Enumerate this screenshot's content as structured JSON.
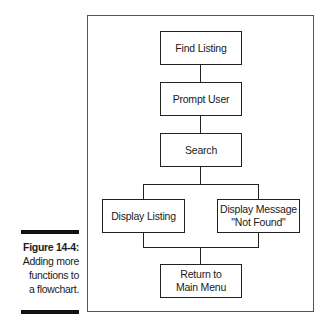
{
  "figure": {
    "number_label": "Figure 14-4:",
    "caption_lines": [
      "Adding more",
      "functions to",
      "a flowchart."
    ]
  },
  "flowchart": {
    "nodes": [
      {
        "id": "find-listing",
        "lines": [
          "Find Listing"
        ]
      },
      {
        "id": "prompt-user",
        "lines": [
          "Prompt User"
        ]
      },
      {
        "id": "search",
        "lines": [
          "Search"
        ]
      },
      {
        "id": "display-listing",
        "lines": [
          "Display Listing"
        ]
      },
      {
        "id": "display-message",
        "lines": [
          "Display Message",
          "\"Not Found\""
        ]
      },
      {
        "id": "return-main-menu",
        "lines": [
          "Return to",
          "Main Menu"
        ]
      }
    ],
    "edges": [
      [
        "find-listing",
        "prompt-user"
      ],
      [
        "prompt-user",
        "search"
      ],
      [
        "search",
        "display-listing"
      ],
      [
        "search",
        "display-message"
      ],
      [
        "display-listing",
        "return-main-menu"
      ],
      [
        "display-message",
        "return-main-menu"
      ]
    ]
  },
  "colors": {
    "line": "#222222",
    "frame": "#555555",
    "bar": "#111111"
  }
}
